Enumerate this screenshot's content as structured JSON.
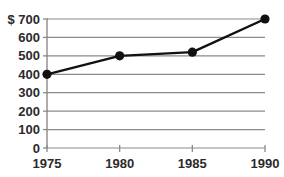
{
  "chart_data": {
    "type": "line",
    "title": "",
    "xlabel": "",
    "ylabel": "",
    "categories": [
      "1975",
      "1980",
      "1985",
      "1990"
    ],
    "x": [
      1975,
      1980,
      1985,
      1990
    ],
    "values": [
      400,
      500,
      520,
      700
    ],
    "series": [
      {
        "name": "",
        "values": [
          400,
          500,
          520,
          700
        ]
      }
    ],
    "ylim": [
      0,
      700
    ],
    "xlim": [
      1975,
      1990
    ],
    "y_ticks": [
      0,
      100,
      200,
      300,
      400,
      500,
      600,
      700
    ],
    "y_tick_labels": [
      "0",
      "100",
      "200",
      "300",
      "400",
      "500",
      "600",
      "$ 700"
    ],
    "x_ticks": [
      1975,
      1980,
      1985,
      1990
    ],
    "x_tick_labels": [
      "1975",
      "1980",
      "1985",
      "1990"
    ],
    "currency_symbol": "$",
    "grid": true,
    "grid_orientation": "horizontal",
    "legend": false,
    "legend_position": "none",
    "marker": "filled-circle",
    "colors": {
      "line": "#111111",
      "marker": "#111111",
      "grid": "#8a8a8a",
      "axis": "#8a8a8a",
      "text": "#2b2b2b",
      "background": "#ffffff"
    }
  }
}
